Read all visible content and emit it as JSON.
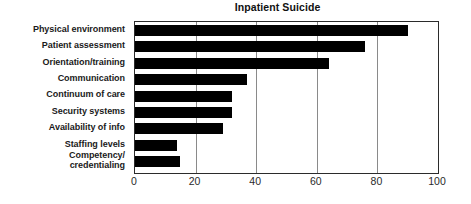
{
  "chart_data": {
    "type": "bar",
    "orientation": "horizontal",
    "title": "Inpatient Suicide",
    "xlabel": "",
    "ylabel": "",
    "xlim": [
      0,
      100
    ],
    "xticks": [
      0,
      20,
      40,
      60,
      80,
      100
    ],
    "xtick_labels": [
      "0",
      "20",
      "40",
      "60",
      "80",
      "100"
    ],
    "grid": "vertical",
    "legend": "none",
    "bar_color": "#000000",
    "categories": [
      "Physical environment",
      "Patient assessment",
      "Orientation/training",
      "Communication",
      "Continuum of care",
      "Security systems",
      "Availability of info",
      "Staffing levels",
      "Competency/\ncredentialing"
    ],
    "values": [
      90,
      76,
      64,
      37,
      32,
      32,
      29,
      14,
      15
    ]
  }
}
